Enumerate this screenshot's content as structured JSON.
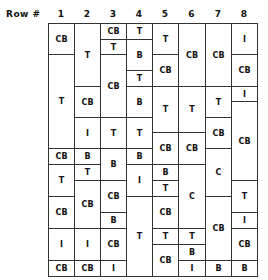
{
  "header": {
    "row_label": "Row #",
    "columns": [
      "1",
      "2",
      "3",
      "4",
      "5",
      "6",
      "7",
      "8"
    ]
  },
  "grid": {
    "col_x": [
      48,
      74,
      100,
      126,
      152,
      178,
      205,
      231,
      257
    ],
    "columns": [
      {
        "col": 1,
        "cells": [
          {
            "y0": 23,
            "y1": 54,
            "label": "CB"
          },
          {
            "y0": 54,
            "y1": 148,
            "label": "T"
          },
          {
            "y0": 148,
            "y1": 164,
            "label": "CB"
          },
          {
            "y0": 164,
            "y1": 196,
            "label": "T"
          },
          {
            "y0": 196,
            "y1": 228,
            "label": "CB"
          },
          {
            "y0": 228,
            "y1": 260,
            "label": "I"
          },
          {
            "y0": 260,
            "y1": 276,
            "label": "CB"
          }
        ]
      },
      {
        "col": 2,
        "cells": [
          {
            "y0": 23,
            "y1": 86,
            "label": "T"
          },
          {
            "y0": 86,
            "y1": 117,
            "label": "CB"
          },
          {
            "y0": 117,
            "y1": 148,
            "label": "I"
          },
          {
            "y0": 148,
            "y1": 164,
            "label": "B"
          },
          {
            "y0": 164,
            "y1": 180,
            "label": "T"
          },
          {
            "y0": 180,
            "y1": 228,
            "label": "CB"
          },
          {
            "y0": 228,
            "y1": 260,
            "label": "I"
          },
          {
            "y0": 260,
            "y1": 276,
            "label": "CB"
          }
        ]
      },
      {
        "col": 3,
        "cells": [
          {
            "y0": 23,
            "y1": 39,
            "label": "CB"
          },
          {
            "y0": 39,
            "y1": 54,
            "label": "T"
          },
          {
            "y0": 54,
            "y1": 117,
            "label": "CB"
          },
          {
            "y0": 117,
            "y1": 148,
            "label": "T"
          },
          {
            "y0": 148,
            "y1": 180,
            "label": "B"
          },
          {
            "y0": 180,
            "y1": 212,
            "label": "CB"
          },
          {
            "y0": 212,
            "y1": 228,
            "label": "B"
          },
          {
            "y0": 228,
            "y1": 260,
            "label": "CB"
          },
          {
            "y0": 260,
            "y1": 276,
            "label": "I"
          }
        ]
      },
      {
        "col": 4,
        "cells": [
          {
            "y0": 23,
            "y1": 39,
            "label": "T"
          },
          {
            "y0": 39,
            "y1": 70,
            "label": "B"
          },
          {
            "y0": 70,
            "y1": 86,
            "label": "T"
          },
          {
            "y0": 86,
            "y1": 117,
            "label": "B"
          },
          {
            "y0": 117,
            "y1": 148,
            "label": "T"
          },
          {
            "y0": 148,
            "y1": 164,
            "label": "B"
          },
          {
            "y0": 164,
            "y1": 196,
            "label": "I"
          },
          {
            "y0": 196,
            "y1": 276,
            "label": "T"
          }
        ]
      },
      {
        "col": 5,
        "cells": [
          {
            "y0": 23,
            "y1": 54,
            "label": "T"
          },
          {
            "y0": 54,
            "y1": 86,
            "label": "CB"
          },
          {
            "y0": 86,
            "y1": 132,
            "label": "T"
          },
          {
            "y0": 132,
            "y1": 164,
            "label": "CB"
          },
          {
            "y0": 164,
            "y1": 180,
            "label": "B"
          },
          {
            "y0": 180,
            "y1": 196,
            "label": "T"
          },
          {
            "y0": 196,
            "y1": 228,
            "label": "CB"
          },
          {
            "y0": 228,
            "y1": 244,
            "label": "T"
          },
          {
            "y0": 244,
            "y1": 276,
            "label": "CB"
          }
        ]
      },
      {
        "col": 6,
        "cells": [
          {
            "y0": 23,
            "y1": 86,
            "label": "CB"
          },
          {
            "y0": 86,
            "y1": 132,
            "label": "T"
          },
          {
            "y0": 132,
            "y1": 164,
            "label": "CB"
          },
          {
            "y0": 164,
            "y1": 228,
            "label": "C"
          },
          {
            "y0": 228,
            "y1": 244,
            "label": "T"
          },
          {
            "y0": 244,
            "y1": 260,
            "label": "B"
          },
          {
            "y0": 260,
            "y1": 276,
            "label": "I"
          }
        ]
      },
      {
        "col": 7,
        "cells": [
          {
            "y0": 23,
            "y1": 86,
            "label": "CB"
          },
          {
            "y0": 86,
            "y1": 117,
            "label": "T"
          },
          {
            "y0": 117,
            "y1": 148,
            "label": "CB"
          },
          {
            "y0": 148,
            "y1": 196,
            "label": "C"
          },
          {
            "y0": 196,
            "y1": 260,
            "label": "CB"
          },
          {
            "y0": 260,
            "y1": 276,
            "label": "B"
          }
        ]
      },
      {
        "col": 8,
        "cells": [
          {
            "y0": 23,
            "y1": 54,
            "label": "I"
          },
          {
            "y0": 54,
            "y1": 86,
            "label": "CB"
          },
          {
            "y0": 86,
            "y1": 101,
            "label": "I"
          },
          {
            "y0": 101,
            "y1": 180,
            "label": "CB"
          },
          {
            "y0": 180,
            "y1": 212,
            "label": "T"
          },
          {
            "y0": 212,
            "y1": 228,
            "label": "I"
          },
          {
            "y0": 228,
            "y1": 260,
            "label": "CB"
          },
          {
            "y0": 260,
            "y1": 276,
            "label": "B"
          }
        ]
      }
    ]
  }
}
